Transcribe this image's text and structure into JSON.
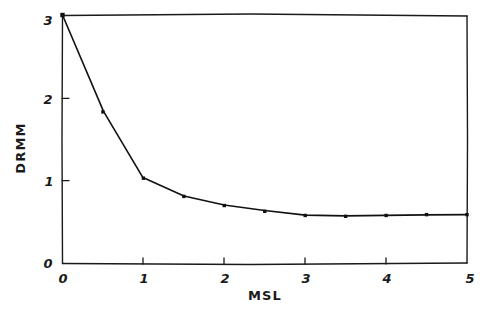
{
  "chart_data": {
    "type": "line",
    "title": "",
    "xlabel": "MSL",
    "ylabel": "DRMM",
    "xlim": [
      0,
      5
    ],
    "ylim": [
      0,
      3
    ],
    "xticks": [
      "0",
      "1",
      "2",
      "3",
      "4",
      "5"
    ],
    "xtick_values": [
      0,
      1,
      2,
      3,
      4,
      5
    ],
    "yticks": [
      "0",
      "1",
      "2",
      "3"
    ],
    "ytick_values": [
      0,
      1,
      2,
      3
    ],
    "grid": false,
    "legend": null,
    "style": "hand-drawn",
    "marker": "filled-square",
    "series": [
      {
        "name": "DRMM vs MSL",
        "x": [
          0,
          0.5,
          1.0,
          1.5,
          2.0,
          2.5,
          3.0,
          3.5,
          4.0,
          4.5,
          5.0
        ],
        "y": [
          3.0,
          1.83,
          1.03,
          0.81,
          0.7,
          0.63,
          0.58,
          0.57,
          0.58,
          0.59,
          0.59
        ]
      }
    ]
  },
  "axes": {
    "x_label": "MSL",
    "y_label": "DRMM"
  }
}
